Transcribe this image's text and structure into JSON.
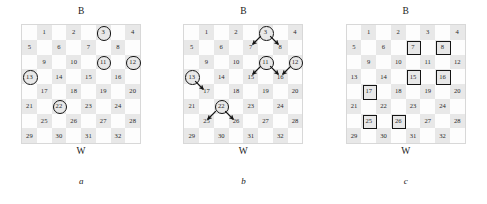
{
  "figure": {
    "panels": [
      {
        "id": "a",
        "caption": "a",
        "top_label": "B",
        "bottom_label": "W",
        "circled_squares": [
          3,
          11,
          12,
          13,
          22
        ],
        "boxed_squares": [],
        "arrows": []
      },
      {
        "id": "b",
        "caption": "b",
        "top_label": "B",
        "bottom_label": "W",
        "circled_squares": [
          3,
          11,
          12,
          13,
          22
        ],
        "boxed_squares": [],
        "arrows": [
          {
            "from": 3,
            "to": 7
          },
          {
            "from": 3,
            "to": 8
          },
          {
            "from": 11,
            "to": 15
          },
          {
            "from": 11,
            "to": 16
          },
          {
            "from": 12,
            "to": 16
          },
          {
            "from": 13,
            "to": 17
          },
          {
            "from": 22,
            "to": 25
          },
          {
            "from": 22,
            "to": 26
          }
        ]
      },
      {
        "id": "c",
        "caption": "c",
        "top_label": "B",
        "bottom_label": "W",
        "circled_squares": [],
        "boxed_squares": [
          7,
          8,
          15,
          16,
          17,
          25,
          26
        ],
        "arrows": []
      }
    ],
    "board": {
      "rows": 8,
      "columns": 8,
      "numbered_squares": [
        1,
        2,
        3,
        4,
        5,
        6,
        7,
        8,
        9,
        10,
        11,
        12,
        13,
        14,
        15,
        16,
        17,
        18,
        19,
        20,
        21,
        22,
        23,
        24,
        25,
        26,
        27,
        28,
        29,
        30,
        31,
        32
      ],
      "dark_square_color": "#e8e8e8",
      "light_square_color": "#fdfdfd",
      "border_color": "#d8d8d8",
      "marker_color": "#141414"
    }
  }
}
